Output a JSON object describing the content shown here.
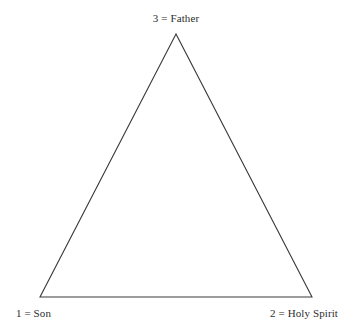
{
  "figure": {
    "background_color": "#ffffff",
    "stroke_color": "#3a3a3a",
    "text_color": "#2e2e2e",
    "stroke_width": 1.1,
    "width": 354,
    "height": 335
  },
  "diagram": {
    "type": "triangle",
    "vertices": [
      {
        "id": "apex",
        "x": 176,
        "y": 34,
        "number": "3",
        "name": "Father"
      },
      {
        "id": "bottom-left",
        "x": 40,
        "y": 297,
        "number": "1",
        "name": "Son"
      },
      {
        "id": "bottom-right",
        "x": 312,
        "y": 297,
        "number": "2",
        "name": "Holy Spirit"
      }
    ],
    "points_attribute": "176,34 40,297 312,297"
  },
  "labels": {
    "apex": "3 = Father",
    "bottom_left": "1 = Son",
    "bottom_right": "2 = Holy Spirit"
  }
}
